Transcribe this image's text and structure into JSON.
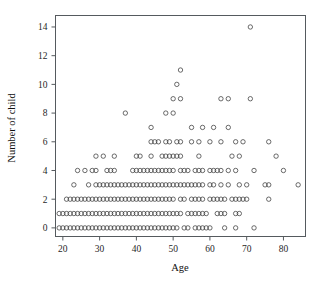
{
  "chart_data": {
    "type": "scatter",
    "title": "",
    "xlabel": "Age",
    "ylabel": "Number of child",
    "xlim": [
      18,
      86
    ],
    "ylim": [
      -0.6,
      14.8
    ],
    "grid": false,
    "legend": "none",
    "x_ticks": [
      20,
      30,
      40,
      50,
      60,
      70,
      80
    ],
    "y_ticks": [
      0,
      2,
      4,
      6,
      8,
      10,
      12,
      14
    ],
    "marker": "open-circle",
    "marker_size_px": 3.2,
    "points": [
      [
        19,
        0
      ],
      [
        20,
        0
      ],
      [
        21,
        0
      ],
      [
        22,
        0
      ],
      [
        23,
        0
      ],
      [
        24,
        0
      ],
      [
        25,
        0
      ],
      [
        26,
        0
      ],
      [
        27,
        0
      ],
      [
        28,
        0
      ],
      [
        29,
        0
      ],
      [
        30,
        0
      ],
      [
        31,
        0
      ],
      [
        32,
        0
      ],
      [
        33,
        0
      ],
      [
        34,
        0
      ],
      [
        35,
        0
      ],
      [
        36,
        0
      ],
      [
        37,
        0
      ],
      [
        38,
        0
      ],
      [
        39,
        0
      ],
      [
        40,
        0
      ],
      [
        41,
        0
      ],
      [
        42,
        0
      ],
      [
        43,
        0
      ],
      [
        44,
        0
      ],
      [
        45,
        0
      ],
      [
        46,
        0
      ],
      [
        47,
        0
      ],
      [
        48,
        0
      ],
      [
        49,
        0
      ],
      [
        50,
        0
      ],
      [
        51,
        0
      ],
      [
        53,
        0
      ],
      [
        54,
        0
      ],
      [
        56,
        0
      ],
      [
        57,
        0
      ],
      [
        58,
        0
      ],
      [
        59,
        0
      ],
      [
        60,
        0
      ],
      [
        64,
        0
      ],
      [
        67,
        0
      ],
      [
        72,
        0
      ],
      [
        19,
        1
      ],
      [
        20,
        1
      ],
      [
        21,
        1
      ],
      [
        22,
        1
      ],
      [
        23,
        1
      ],
      [
        24,
        1
      ],
      [
        25,
        1
      ],
      [
        26,
        1
      ],
      [
        27,
        1
      ],
      [
        28,
        1
      ],
      [
        29,
        1
      ],
      [
        30,
        1
      ],
      [
        31,
        1
      ],
      [
        32,
        1
      ],
      [
        33,
        1
      ],
      [
        34,
        1
      ],
      [
        35,
        1
      ],
      [
        36,
        1
      ],
      [
        37,
        1
      ],
      [
        38,
        1
      ],
      [
        39,
        1
      ],
      [
        40,
        1
      ],
      [
        41,
        1
      ],
      [
        42,
        1
      ],
      [
        43,
        1
      ],
      [
        44,
        1
      ],
      [
        45,
        1
      ],
      [
        46,
        1
      ],
      [
        47,
        1
      ],
      [
        48,
        1
      ],
      [
        49,
        1
      ],
      [
        50,
        1
      ],
      [
        51,
        1
      ],
      [
        52,
        1
      ],
      [
        54,
        1
      ],
      [
        55,
        1
      ],
      [
        56,
        1
      ],
      [
        57,
        1
      ],
      [
        58,
        1
      ],
      [
        59,
        1
      ],
      [
        62,
        1
      ],
      [
        63,
        1
      ],
      [
        64,
        1
      ],
      [
        67,
        1
      ],
      [
        68,
        1
      ],
      [
        21,
        2
      ],
      [
        22,
        2
      ],
      [
        23,
        2
      ],
      [
        24,
        2
      ],
      [
        25,
        2
      ],
      [
        26,
        2
      ],
      [
        27,
        2
      ],
      [
        28,
        2
      ],
      [
        29,
        2
      ],
      [
        30,
        2
      ],
      [
        31,
        2
      ],
      [
        32,
        2
      ],
      [
        33,
        2
      ],
      [
        34,
        2
      ],
      [
        35,
        2
      ],
      [
        36,
        2
      ],
      [
        37,
        2
      ],
      [
        38,
        2
      ],
      [
        39,
        2
      ],
      [
        40,
        2
      ],
      [
        41,
        2
      ],
      [
        42,
        2
      ],
      [
        43,
        2
      ],
      [
        44,
        2
      ],
      [
        45,
        2
      ],
      [
        46,
        2
      ],
      [
        47,
        2
      ],
      [
        48,
        2
      ],
      [
        49,
        2
      ],
      [
        50,
        2
      ],
      [
        52,
        2
      ],
      [
        53,
        2
      ],
      [
        55,
        2
      ],
      [
        56,
        2
      ],
      [
        57,
        2
      ],
      [
        58,
        2
      ],
      [
        60,
        2
      ],
      [
        61,
        2
      ],
      [
        62,
        2
      ],
      [
        63,
        2
      ],
      [
        64,
        2
      ],
      [
        66,
        2
      ],
      [
        67,
        2
      ],
      [
        68,
        2
      ],
      [
        69,
        2
      ],
      [
        70,
        2
      ],
      [
        76,
        2
      ],
      [
        23,
        3
      ],
      [
        27,
        3
      ],
      [
        29,
        3
      ],
      [
        30,
        3
      ],
      [
        31,
        3
      ],
      [
        32,
        3
      ],
      [
        33,
        3
      ],
      [
        34,
        3
      ],
      [
        35,
        3
      ],
      [
        36,
        3
      ],
      [
        37,
        3
      ],
      [
        38,
        3
      ],
      [
        39,
        3
      ],
      [
        40,
        3
      ],
      [
        41,
        3
      ],
      [
        42,
        3
      ],
      [
        43,
        3
      ],
      [
        44,
        3
      ],
      [
        45,
        3
      ],
      [
        46,
        3
      ],
      [
        47,
        3
      ],
      [
        48,
        3
      ],
      [
        49,
        3
      ],
      [
        50,
        3
      ],
      [
        51,
        3
      ],
      [
        52,
        3
      ],
      [
        53,
        3
      ],
      [
        54,
        3
      ],
      [
        55,
        3
      ],
      [
        56,
        3
      ],
      [
        57,
        3
      ],
      [
        58,
        3
      ],
      [
        60,
        3
      ],
      [
        61,
        3
      ],
      [
        63,
        3
      ],
      [
        65,
        3
      ],
      [
        68,
        3
      ],
      [
        70,
        3
      ],
      [
        75,
        3
      ],
      [
        76,
        3
      ],
      [
        84,
        3
      ],
      [
        24,
        4
      ],
      [
        26,
        4
      ],
      [
        28,
        4
      ],
      [
        29,
        4
      ],
      [
        32,
        4
      ],
      [
        33,
        4
      ],
      [
        34,
        4
      ],
      [
        39,
        4
      ],
      [
        40,
        4
      ],
      [
        41,
        4
      ],
      [
        42,
        4
      ],
      [
        43,
        4
      ],
      [
        44,
        4
      ],
      [
        45,
        4
      ],
      [
        46,
        4
      ],
      [
        47,
        4
      ],
      [
        48,
        4
      ],
      [
        49,
        4
      ],
      [
        50,
        4
      ],
      [
        52,
        4
      ],
      [
        53,
        4
      ],
      [
        54,
        4
      ],
      [
        56,
        4
      ],
      [
        57,
        4
      ],
      [
        58,
        4
      ],
      [
        60,
        4
      ],
      [
        61,
        4
      ],
      [
        62,
        4
      ],
      [
        63,
        4
      ],
      [
        65,
        4
      ],
      [
        67,
        4
      ],
      [
        72,
        4
      ],
      [
        80,
        4
      ],
      [
        29,
        5
      ],
      [
        31,
        5
      ],
      [
        34,
        5
      ],
      [
        40,
        5
      ],
      [
        41,
        5
      ],
      [
        44,
        5
      ],
      [
        47,
        5
      ],
      [
        48,
        5
      ],
      [
        49,
        5
      ],
      [
        50,
        5
      ],
      [
        51,
        5
      ],
      [
        52,
        5
      ],
      [
        57,
        5
      ],
      [
        66,
        5
      ],
      [
        68,
        5
      ],
      [
        78,
        5
      ],
      [
        44,
        6
      ],
      [
        45,
        6
      ],
      [
        46,
        6
      ],
      [
        48,
        6
      ],
      [
        49,
        6
      ],
      [
        51,
        6
      ],
      [
        52,
        6
      ],
      [
        55,
        6
      ],
      [
        57,
        6
      ],
      [
        60,
        6
      ],
      [
        63,
        6
      ],
      [
        67,
        6
      ],
      [
        69,
        6
      ],
      [
        76,
        6
      ],
      [
        44,
        7
      ],
      [
        55,
        7
      ],
      [
        58,
        7
      ],
      [
        61,
        7
      ],
      [
        65,
        7
      ],
      [
        37,
        8
      ],
      [
        48,
        8
      ],
      [
        50,
        8
      ],
      [
        50,
        9
      ],
      [
        52,
        9
      ],
      [
        63,
        9
      ],
      [
        65,
        9
      ],
      [
        71,
        9
      ],
      [
        51,
        10
      ],
      [
        52,
        11
      ],
      [
        71,
        14
      ]
    ]
  }
}
